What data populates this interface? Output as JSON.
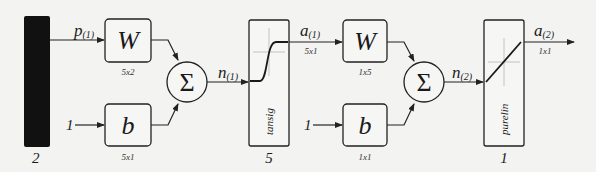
{
  "diagram": {
    "type": "two-layer-neural-network",
    "input": {
      "label": "p",
      "subscript": "(1)",
      "size": "2",
      "color": "#111111"
    },
    "layer1": {
      "weight": {
        "symbol": "W",
        "dims": "5x2"
      },
      "bias": {
        "symbol": "b",
        "dims": "5x1",
        "input": "1"
      },
      "sum": {
        "symbol": "Σ"
      },
      "net": {
        "label": "n",
        "subscript": "(1)"
      },
      "transfer": {
        "name": "tansig",
        "neurons": "5"
      },
      "output": {
        "label": "a",
        "subscript": "(1)",
        "dims": "5x1"
      }
    },
    "layer2": {
      "weight": {
        "symbol": "W",
        "dims": "1x5"
      },
      "bias": {
        "symbol": "b",
        "dims": "1x1",
        "input": "1"
      },
      "sum": {
        "symbol": "Σ"
      },
      "net": {
        "label": "n",
        "subscript": "(2)"
      },
      "transfer": {
        "name": "purelin",
        "neurons": "1"
      },
      "output": {
        "label": "a",
        "subscript": "(2)",
        "dims": "1x1"
      }
    }
  }
}
